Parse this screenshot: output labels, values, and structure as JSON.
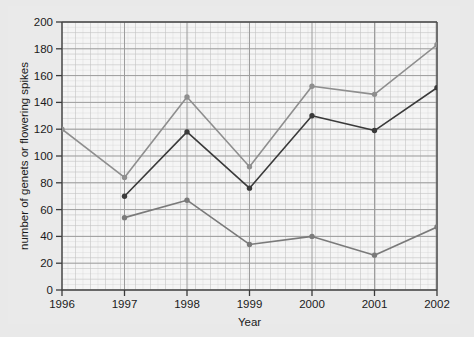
{
  "chart_data": {
    "type": "line",
    "title": "",
    "subtitle": "",
    "xlabel": "Year",
    "ylabel": "number of genets or flowering spikes",
    "categories": [
      1996,
      1997,
      1998,
      1999,
      2000,
      2001,
      2002
    ],
    "x": [
      1996,
      1997,
      1998,
      1999,
      2000,
      2001,
      2002
    ],
    "xlim": [
      1996,
      2002
    ],
    "ylim": [
      0,
      200
    ],
    "yticks": [
      0,
      20,
      40,
      60,
      80,
      100,
      120,
      140,
      160,
      180,
      200
    ],
    "xticks": [
      1996,
      1997,
      1998,
      1999,
      2000,
      2001,
      2002
    ],
    "xtick_labels": [
      "1996",
      "1997",
      "1998",
      "1999",
      "2000",
      "2001",
      "2002"
    ],
    "ytick_labels": [
      "0",
      "20",
      "40",
      "60",
      "80",
      "100",
      "120",
      "140",
      "160",
      "180",
      "200"
    ],
    "grid": true,
    "grid_minor": true,
    "legend": false,
    "legend_position": "none",
    "marker": "circle",
    "series": [
      {
        "name": "series-1",
        "color": "#8e8e8e",
        "x": [
          1996,
          1997,
          1998,
          1999,
          2000,
          2001,
          2002
        ],
        "values": [
          120,
          84,
          144,
          92,
          152,
          146,
          183
        ]
      },
      {
        "name": "series-2",
        "color": "#3a3a3a",
        "x": [
          1997,
          1998,
          1999,
          2000,
          2001,
          2002
        ],
        "values": [
          70,
          118,
          76,
          130,
          119,
          151
        ]
      },
      {
        "name": "series-3",
        "color": "#7a7a7a",
        "x": [
          1997,
          1998,
          1999,
          2000,
          2001,
          2002
        ],
        "values": [
          54,
          67,
          34,
          40,
          26,
          47
        ]
      }
    ],
    "colors": {
      "series_1": "#8e8e8e",
      "series_2": "#3a3a3a",
      "series_3": "#7a7a7a",
      "background": "#e9e9e9",
      "plot_background": "#f4f4f4",
      "grid_major": "#9a9a9a",
      "grid_minor": "#c9c9c9",
      "axis": "#4a4a4a",
      "text": "#1b1b1b"
    }
  }
}
